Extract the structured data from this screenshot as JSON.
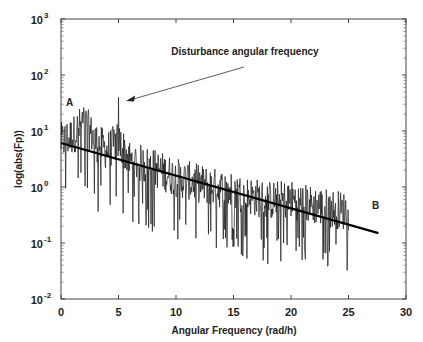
{
  "chart_data": {
    "type": "line",
    "title": "",
    "xlabel": "Angular Frequency (rad/h)",
    "ylabel": "log(abs(Fp))",
    "xlim": [
      0,
      30
    ],
    "ylim": [
      0.01,
      1000
    ],
    "yscale": "log",
    "grid": false,
    "legend": null,
    "x_ticks": [
      0,
      5,
      10,
      15,
      20,
      25,
      30
    ],
    "x_tick_labels": [
      "0",
      "5",
      "10",
      "15",
      "20",
      "25",
      "30"
    ],
    "y_ticks": [
      0.01,
      0.1,
      1,
      10,
      100,
      1000
    ],
    "y_tick_labels": [
      {
        "base": "10",
        "exp": "-2"
      },
      {
        "base": "10",
        "exp": "-1"
      },
      {
        "base": "10",
        "exp": "0"
      },
      {
        "base": "10",
        "exp": "1"
      },
      {
        "base": "10",
        "exp": "2"
      },
      {
        "base": "10",
        "exp": "3"
      }
    ],
    "series": [
      {
        "name": "spectrum |Fp|",
        "description": "Noisy magnitude spectrum from 0 to ~25 rad/h, decaying with frequency; peak cluster near 1.5-2 rad/h (label A) up to ~50; distinct spike at ~5 rad/h reaching ~40",
        "x_range": [
          0,
          25
        ],
        "envelope": {
          "x": [
            0,
            1,
            2,
            3,
            4,
            5,
            6,
            8,
            10,
            12,
            15,
            18,
            20,
            22,
            25
          ],
          "upper": [
            15,
            20,
            50,
            25,
            12,
            40,
            8,
            6,
            4,
            3,
            2,
            1.5,
            1.3,
            1.0,
            0.8
          ],
          "lower": [
            0.5,
            0.6,
            0.8,
            0.3,
            0.3,
            0.2,
            0.2,
            0.15,
            0.1,
            0.08,
            0.06,
            0.04,
            0.05,
            0.04,
            0.03
          ]
        },
        "spike": {
          "x": 5.0,
          "y": 40
        }
      },
      {
        "name": "fitted trend",
        "type": "line",
        "x": [
          0,
          27.6
        ],
        "y": [
          6.1,
          0.15
        ],
        "color": "#000000"
      }
    ],
    "annotations": [
      {
        "text": "Disturbance angular frequency",
        "arrow_to": {
          "x": 5.2,
          "y": 40
        }
      },
      {
        "text": "A",
        "x": 0.5,
        "y": 20
      },
      {
        "text": "B",
        "x": 27.5,
        "y": 0.3
      }
    ]
  },
  "labels": {
    "xlabel": "Angular Frequency (rad/h)",
    "ylabel": "log(abs(Fp))",
    "annotation_disturbance": "Disturbance angular frequency",
    "marker_a": "A",
    "marker_b": "B"
  }
}
